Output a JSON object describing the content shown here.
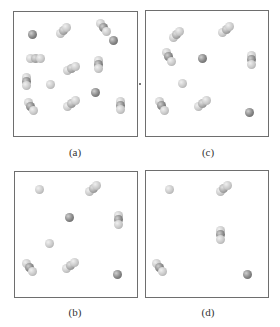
{
  "figure": {
    "panels": [
      {
        "id": "a",
        "label": "(a)",
        "box": {
          "x": 13,
          "y": 11,
          "w": 125,
          "h": 126
        },
        "label_pos": {
          "x": 55,
          "y": 146
        },
        "atoms": [
          {
            "x": 32,
            "y": 34,
            "shade": "dark"
          },
          {
            "x": 60,
            "y": 33,
            "shade": "light"
          },
          {
            "x": 63,
            "y": 30,
            "shade": "mid"
          },
          {
            "x": 66,
            "y": 27,
            "shade": "light"
          },
          {
            "x": 100,
            "y": 23,
            "shade": "light"
          },
          {
            "x": 103,
            "y": 27,
            "shade": "dark"
          },
          {
            "x": 106,
            "y": 31,
            "shade": "light"
          },
          {
            "x": 113,
            "y": 40,
            "shade": "dark"
          },
          {
            "x": 30,
            "y": 58,
            "shade": "light"
          },
          {
            "x": 35,
            "y": 58,
            "shade": "mid"
          },
          {
            "x": 40,
            "y": 58,
            "shade": "light"
          },
          {
            "x": 67,
            "y": 70,
            "shade": "light"
          },
          {
            "x": 71,
            "y": 68,
            "shade": "mid"
          },
          {
            "x": 75,
            "y": 66,
            "shade": "light"
          },
          {
            "x": 98,
            "y": 60,
            "shade": "light"
          },
          {
            "x": 98,
            "y": 64,
            "shade": "dark"
          },
          {
            "x": 98,
            "y": 68,
            "shade": "light"
          },
          {
            "x": 26,
            "y": 77,
            "shade": "light"
          },
          {
            "x": 26,
            "y": 81,
            "shade": "dark"
          },
          {
            "x": 26,
            "y": 85,
            "shade": "light"
          },
          {
            "x": 50,
            "y": 84,
            "shade": "light"
          },
          {
            "x": 95,
            "y": 92,
            "shade": "dark"
          },
          {
            "x": 67,
            "y": 106,
            "shade": "light"
          },
          {
            "x": 71,
            "y": 103,
            "shade": "mid"
          },
          {
            "x": 75,
            "y": 100,
            "shade": "light"
          },
          {
            "x": 28,
            "y": 102,
            "shade": "light"
          },
          {
            "x": 30,
            "y": 106,
            "shade": "dark"
          },
          {
            "x": 33,
            "y": 110,
            "shade": "light"
          },
          {
            "x": 120,
            "y": 101,
            "shade": "light"
          },
          {
            "x": 120,
            "y": 105,
            "shade": "dark"
          },
          {
            "x": 120,
            "y": 109,
            "shade": "light"
          }
        ]
      },
      {
        "id": "c",
        "label": "(c)",
        "box": {
          "x": 145,
          "y": 10,
          "w": 124,
          "h": 127
        },
        "label_pos": {
          "x": 188,
          "y": 146
        },
        "atoms": [
          {
            "x": 173,
            "y": 37,
            "shade": "light"
          },
          {
            "x": 176,
            "y": 34,
            "shade": "mid"
          },
          {
            "x": 179,
            "y": 31,
            "shade": "light"
          },
          {
            "x": 222,
            "y": 32,
            "shade": "light"
          },
          {
            "x": 226,
            "y": 29,
            "shade": "mid"
          },
          {
            "x": 229,
            "y": 26,
            "shade": "light"
          },
          {
            "x": 166,
            "y": 52,
            "shade": "light"
          },
          {
            "x": 168,
            "y": 56,
            "shade": "dark"
          },
          {
            "x": 171,
            "y": 61,
            "shade": "light"
          },
          {
            "x": 202,
            "y": 58,
            "shade": "dark"
          },
          {
            "x": 251,
            "y": 55,
            "shade": "light"
          },
          {
            "x": 251,
            "y": 59,
            "shade": "dark"
          },
          {
            "x": 251,
            "y": 64,
            "shade": "light"
          },
          {
            "x": 182,
            "y": 83,
            "shade": "light"
          },
          {
            "x": 159,
            "y": 101,
            "shade": "light"
          },
          {
            "x": 161,
            "y": 105,
            "shade": "dark"
          },
          {
            "x": 164,
            "y": 110,
            "shade": "light"
          },
          {
            "x": 198,
            "y": 106,
            "shade": "light"
          },
          {
            "x": 202,
            "y": 103,
            "shade": "mid"
          },
          {
            "x": 206,
            "y": 100,
            "shade": "light"
          },
          {
            "x": 249,
            "y": 112,
            "shade": "dark"
          }
        ]
      },
      {
        "id": "b",
        "label": "(b)",
        "box": {
          "x": 14,
          "y": 171,
          "w": 124,
          "h": 127
        },
        "label_pos": {
          "x": 55,
          "y": 306
        },
        "atoms": [
          {
            "x": 39,
            "y": 189,
            "shade": "light"
          },
          {
            "x": 89,
            "y": 191,
            "shade": "light"
          },
          {
            "x": 93,
            "y": 188,
            "shade": "mid"
          },
          {
            "x": 96,
            "y": 185,
            "shade": "light"
          },
          {
            "x": 69,
            "y": 217,
            "shade": "dark"
          },
          {
            "x": 118,
            "y": 215,
            "shade": "light"
          },
          {
            "x": 118,
            "y": 219,
            "shade": "dark"
          },
          {
            "x": 118,
            "y": 224,
            "shade": "light"
          },
          {
            "x": 49,
            "y": 243,
            "shade": "light"
          },
          {
            "x": 26,
            "y": 263,
            "shade": "light"
          },
          {
            "x": 29,
            "y": 267,
            "shade": "dark"
          },
          {
            "x": 32,
            "y": 271,
            "shade": "light"
          },
          {
            "x": 66,
            "y": 268,
            "shade": "light"
          },
          {
            "x": 70,
            "y": 265,
            "shade": "mid"
          },
          {
            "x": 74,
            "y": 262,
            "shade": "light"
          },
          {
            "x": 117,
            "y": 274,
            "shade": "dark"
          }
        ]
      },
      {
        "id": "d",
        "label": "(d)",
        "box": {
          "x": 145,
          "y": 170,
          "w": 124,
          "h": 128
        },
        "label_pos": {
          "x": 188,
          "y": 306
        },
        "atoms": [
          {
            "x": 169,
            "y": 189,
            "shade": "light"
          },
          {
            "x": 220,
            "y": 191,
            "shade": "light"
          },
          {
            "x": 223,
            "y": 188,
            "shade": "mid"
          },
          {
            "x": 227,
            "y": 185,
            "shade": "light"
          },
          {
            "x": 220,
            "y": 230,
            "shade": "light"
          },
          {
            "x": 220,
            "y": 234,
            "shade": "dark"
          },
          {
            "x": 220,
            "y": 239,
            "shade": "light"
          },
          {
            "x": 156,
            "y": 263,
            "shade": "light"
          },
          {
            "x": 159,
            "y": 267,
            "shade": "dark"
          },
          {
            "x": 162,
            "y": 271,
            "shade": "light"
          },
          {
            "x": 247,
            "y": 274,
            "shade": "dark"
          }
        ]
      }
    ]
  }
}
